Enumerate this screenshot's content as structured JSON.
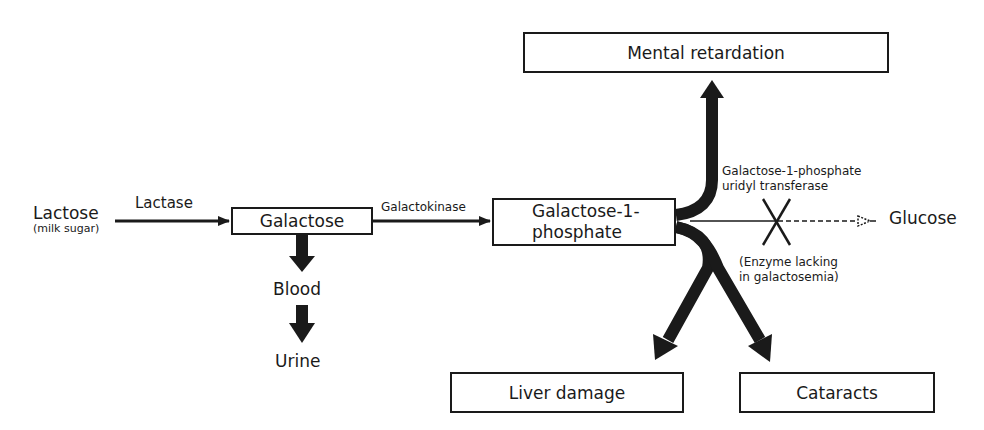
{
  "diagram": {
    "type": "metabolic pathway flowchart",
    "nodes": {
      "lactose": {
        "label": "Lactose",
        "sublabel": "(milk sugar)"
      },
      "galactose": {
        "label": "Galactose"
      },
      "galactose_1_phosphate": {
        "label_line1": "Galactose-1-",
        "label_line2": "phosphate"
      },
      "blood": {
        "label": "Blood"
      },
      "urine": {
        "label": "Urine"
      },
      "glucose": {
        "label": "Glucose"
      },
      "mental_retardation": {
        "label": "Mental retardation"
      },
      "liver_damage": {
        "label": "Liver damage"
      },
      "cataracts": {
        "label": "Cataracts"
      }
    },
    "enzymes": {
      "lactase": "Lactase",
      "galactokinase": "Galactokinase",
      "transferase_line1": "Galactose-1-phosphate",
      "transferase_line2": "uridyl transferase"
    },
    "annotations": {
      "enzyme_lacking_line1": "(Enzyme lacking",
      "enzyme_lacking_line2": "in galactosemia)"
    },
    "edges": [
      {
        "from": "lactose",
        "to": "galactose",
        "label": "Lactase",
        "style": "solid"
      },
      {
        "from": "galactose",
        "to": "galactose_1_phosphate",
        "label": "Galactokinase",
        "style": "solid"
      },
      {
        "from": "galactose",
        "to": "blood",
        "style": "thick"
      },
      {
        "from": "blood",
        "to": "urine",
        "style": "thick"
      },
      {
        "from": "galactose_1_phosphate",
        "to": "glucose",
        "label": "Galactose-1-phosphate uridyl transferase",
        "style": "blocked-dashed"
      },
      {
        "from": "galactose_1_phosphate",
        "to": "mental_retardation",
        "style": "thick"
      },
      {
        "from": "galactose_1_phosphate",
        "to": "liver_damage",
        "style": "thick"
      },
      {
        "from": "galactose_1_phosphate",
        "to": "cataracts",
        "style": "thick"
      }
    ],
    "colors": {
      "ink": "#1a1a1a",
      "background": "#ffffff"
    }
  }
}
